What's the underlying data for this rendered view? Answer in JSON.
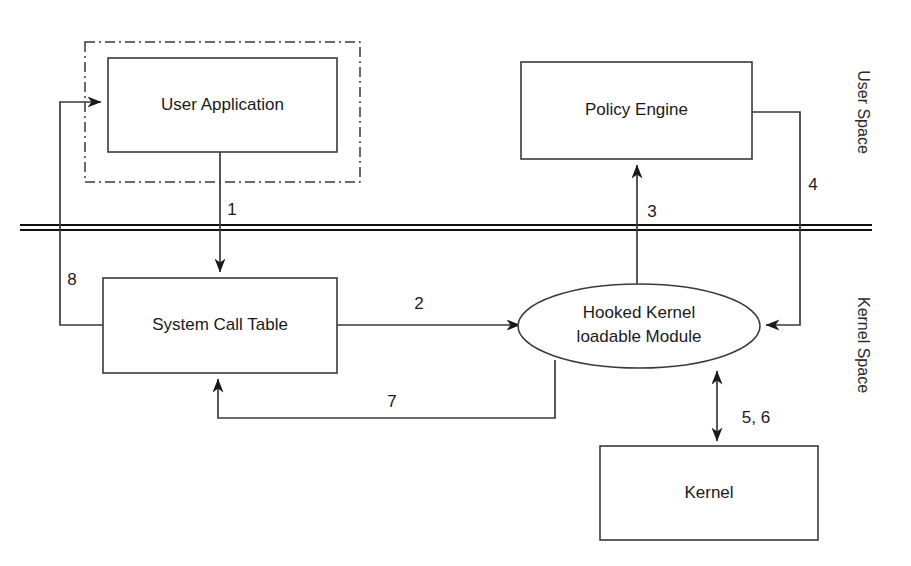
{
  "diagram": {
    "canvas": {
      "width": 911,
      "height": 566,
      "background": "#ffffff"
    },
    "colors": {
      "stroke": "#3a3a3a",
      "text": "#1a1a1a",
      "boundary": "#111111",
      "fill": "#ffffff"
    },
    "regions": [
      {
        "id": "user-application-region",
        "style": "dash-dot",
        "x": 85,
        "y": 42,
        "width": 275,
        "height": 140
      }
    ],
    "boundary": {
      "id": "user-kernel-boundary",
      "style": "double-line",
      "y": 227,
      "x1": 20,
      "x2": 872,
      "gap": 5
    },
    "side_labels": [
      {
        "id": "user-space-label",
        "text": "User Space",
        "x": 862,
        "y": 112,
        "rotation": 90
      },
      {
        "id": "kernel-space-label",
        "text": "Kernel Space",
        "x": 862,
        "y": 345,
        "rotation": 90
      }
    ],
    "nodes": [
      {
        "id": "user-application",
        "shape": "rect",
        "label": "User Application",
        "x": 108,
        "y": 58,
        "width": 229,
        "height": 94
      },
      {
        "id": "policy-engine",
        "shape": "rect",
        "label": "Policy Engine",
        "x": 521,
        "y": 62,
        "width": 231,
        "height": 97
      },
      {
        "id": "system-call-table",
        "shape": "rect",
        "label": "System Call Table",
        "x": 103,
        "y": 278,
        "width": 234,
        "height": 95
      },
      {
        "id": "hooked-kernel-module",
        "shape": "ellipse",
        "label_line1": "Hooked Kernel",
        "label_line2": "loadable Module",
        "cx": 639,
        "cy": 326,
        "rx": 121,
        "ry": 42
      },
      {
        "id": "kernel",
        "shape": "rect",
        "label": "Kernel",
        "x": 600,
        "y": 446,
        "width": 218,
        "height": 94
      }
    ],
    "edges": [
      {
        "id": "edge-1",
        "label": "1",
        "from": "user-application",
        "to": "system-call-table",
        "label_x": 232,
        "label_y": 211,
        "arrow": "single"
      },
      {
        "id": "edge-2",
        "label": "2",
        "from": "system-call-table",
        "to": "hooked-kernel-module",
        "label_x": 419,
        "label_y": 305,
        "arrow": "single"
      },
      {
        "id": "edge-3",
        "label": "3",
        "from": "hooked-kernel-module",
        "to": "policy-engine",
        "label_x": 652,
        "label_y": 213,
        "arrow": "single"
      },
      {
        "id": "edge-4",
        "label": "4",
        "from": "policy-engine",
        "to": "hooked-kernel-module",
        "label_x": 813,
        "label_y": 186,
        "arrow": "single"
      },
      {
        "id": "edge-5-6",
        "label": "5, 6",
        "from": "hooked-kernel-module",
        "to": "kernel",
        "label_x": 756,
        "label_y": 419,
        "arrow": "double"
      },
      {
        "id": "edge-7",
        "label": "7",
        "from": "hooked-kernel-module",
        "to": "system-call-table",
        "label_x": 392,
        "label_y": 403,
        "arrow": "single"
      },
      {
        "id": "edge-8",
        "label": "8",
        "from": "system-call-table",
        "to": "user-application",
        "label_x": 72,
        "label_y": 281,
        "arrow": "single"
      }
    ]
  }
}
